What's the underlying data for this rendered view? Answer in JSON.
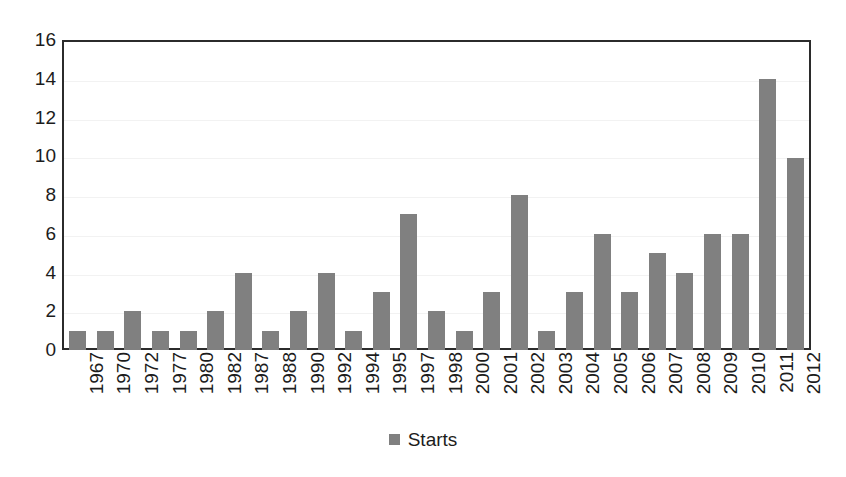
{
  "chart_data": {
    "type": "bar",
    "title": "",
    "subtitle": "",
    "xlabel": "",
    "ylabel": "",
    "ylim": [
      0,
      16
    ],
    "ytick_step": 2,
    "yticks": [
      16,
      14,
      12,
      10,
      8,
      6,
      4,
      2,
      0
    ],
    "grid": true,
    "legend_position": "bottom-center",
    "series_color": "#808080",
    "axis_color": "#2b2b2b",
    "background": "#ffffff",
    "categories": [
      "1967",
      "1970",
      "1972",
      "1977",
      "1980",
      "1982",
      "1987",
      "1988",
      "1990",
      "1992",
      "1994",
      "1995",
      "1997",
      "1998",
      "2000",
      "2001",
      "2002",
      "2003",
      "2004",
      "2005",
      "2006",
      "2007",
      "2008",
      "2009",
      "2010",
      "2011",
      "2012"
    ],
    "series": [
      {
        "name": "Starts",
        "values": [
          1,
          1,
          2,
          1,
          1,
          2,
          4,
          1,
          2,
          4,
          1,
          3,
          7,
          2,
          1,
          3,
          8,
          1,
          3,
          6,
          3,
          5,
          4,
          6,
          6,
          14,
          9.9
        ]
      }
    ]
  },
  "legend": {
    "entries": [
      {
        "label": "Starts",
        "color": "#808080"
      }
    ]
  }
}
